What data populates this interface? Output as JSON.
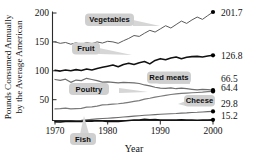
{
  "chart_data": {
    "type": "line",
    "title": "",
    "xlabel": "Year",
    "ylabel": "Pounds Consumed Annually by the Average American",
    "ylabel_line1": "Pounds Consumed Annually",
    "ylabel_line2": "by the Average American",
    "xlim": [
      1970,
      2000
    ],
    "ylim": [
      0,
      210
    ],
    "xticks": [
      1970,
      1980,
      1990,
      2000
    ],
    "xtick_labels": [
      "1970",
      "1980",
      "1990",
      "2000"
    ],
    "yticks": [
      50,
      100,
      150,
      200
    ],
    "ytick_labels": [
      "50",
      "100",
      "150",
      "200"
    ],
    "grid": false,
    "legend_position": "inline-callouts",
    "x": [
      1970,
      1971,
      1972,
      1973,
      1974,
      1975,
      1976,
      1977,
      1978,
      1979,
      1980,
      1981,
      1982,
      1983,
      1984,
      1985,
      1986,
      1987,
      1988,
      1989,
      1990,
      1991,
      1992,
      1993,
      1994,
      1995,
      1996,
      1997,
      1998,
      1999,
      2000
    ],
    "series": [
      {
        "name": "Vegetables",
        "end_value": 201.7,
        "end_label": "201.7",
        "color": "#5a5a5a",
        "values": [
          150.0,
          147.5,
          149.0,
          146.0,
          148.5,
          145.5,
          149.0,
          147.0,
          150.0,
          148.0,
          151.0,
          150.0,
          147.5,
          152.0,
          156.0,
          161.0,
          159.5,
          165.0,
          170.0,
          167.0,
          172.5,
          178.0,
          174.0,
          180.0,
          186.0,
          182.0,
          188.0,
          193.0,
          189.0,
          195.5,
          201.7
        ]
      },
      {
        "name": "Fruit",
        "end_value": 126.8,
        "end_label": "126.8",
        "color": "#111111",
        "values": [
          101.0,
          99.5,
          101.5,
          100.0,
          102.0,
          100.5,
          103.0,
          101.5,
          104.0,
          106.0,
          108.0,
          110.0,
          107.0,
          111.0,
          113.0,
          111.0,
          114.0,
          116.0,
          112.0,
          118.0,
          121.0,
          119.0,
          122.0,
          124.0,
          121.0,
          123.5,
          124.5,
          125.0,
          124.0,
          125.5,
          126.8
        ]
      },
      {
        "name": "Red meats",
        "end_value": 66.5,
        "end_label": "66.5",
        "color": "#6e6e6e",
        "values": [
          85.0,
          83.5,
          85.5,
          80.0,
          84.0,
          83.0,
          87.0,
          85.0,
          83.0,
          80.5,
          81.0,
          80.0,
          79.0,
          80.0,
          79.5,
          79.0,
          78.0,
          75.5,
          74.0,
          71.5,
          70.0,
          69.5,
          70.5,
          69.0,
          70.0,
          69.0,
          68.0,
          67.0,
          68.0,
          67.5,
          66.5
        ]
      },
      {
        "name": "Poultry",
        "end_value": 64.4,
        "end_label": "64.4",
        "color": "#7a7a7a",
        "values": [
          34.0,
          34.5,
          35.5,
          34.0,
          34.5,
          35.0,
          37.0,
          37.5,
          39.0,
          41.0,
          41.5,
          42.5,
          43.0,
          44.0,
          45.5,
          47.0,
          48.5,
          51.0,
          52.5,
          54.5,
          56.0,
          57.5,
          59.0,
          60.0,
          61.0,
          61.5,
          62.0,
          62.5,
          63.0,
          63.8,
          64.4
        ]
      },
      {
        "name": "Cheese",
        "end_value": 29.8,
        "end_label": "29.8",
        "color": "#6b6b6b",
        "values": [
          11.4,
          12.0,
          12.6,
          13.2,
          13.8,
          14.4,
          15.2,
          16.0,
          16.8,
          17.4,
          18.0,
          18.6,
          19.2,
          20.0,
          20.8,
          21.5,
          22.2,
          23.0,
          23.6,
          24.2,
          24.8,
          25.2,
          25.8,
          26.2,
          26.8,
          27.2,
          27.8,
          28.2,
          28.8,
          29.3,
          29.8
        ]
      },
      {
        "name": "Fish",
        "end_value": 15.2,
        "end_label": "15.2",
        "color": "#111111",
        "values": [
          11.8,
          11.5,
          12.5,
          12.7,
          12.1,
          12.2,
          12.9,
          12.6,
          13.4,
          13.0,
          12.4,
          12.6,
          12.3,
          13.3,
          14.1,
          15.0,
          14.7,
          16.1,
          15.1,
          15.6,
          15.0,
          14.8,
          14.7,
          14.9,
          15.1,
          14.9,
          14.7,
          14.5,
          14.8,
          15.0,
          15.2
        ]
      }
    ],
    "annotations": [
      {
        "label": "Vegetables",
        "series": "Vegetables"
      },
      {
        "label": "Fruit",
        "series": "Fruit"
      },
      {
        "label": "Red meats",
        "series": "Red meats"
      },
      {
        "label": "Poultry",
        "series": "Poultry"
      },
      {
        "label": "Cheese",
        "series": "Cheese"
      },
      {
        "label": "Fish",
        "series": "Fish"
      }
    ],
    "colors": {
      "callout_fill": "#cfcfcf",
      "axis": "#2b2b2b",
      "text": "#111111"
    }
  }
}
